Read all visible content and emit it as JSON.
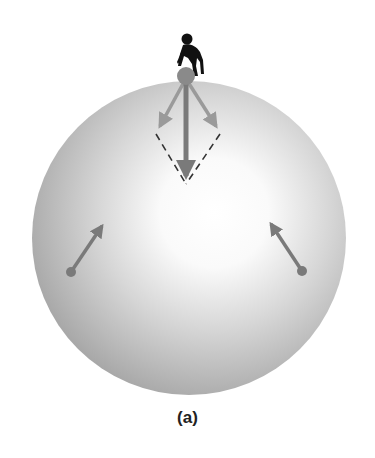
{
  "figure": {
    "caption": "(a)",
    "colors": {
      "sphere_light": "#ffffff",
      "sphere_dark": "#a8a8a8",
      "arrow": "#7a7a7a",
      "dashed": "#333333",
      "person": "#111111"
    },
    "elements": {
      "sphere": {
        "cx": 189,
        "cy": 238,
        "r": 157
      },
      "ball": {
        "cx": 186,
        "cy": 76,
        "r": 9
      },
      "net_force_arrow": {
        "x1": 186,
        "y1": 80,
        "x2": 186,
        "y2": 182
      },
      "component_arrow_left": {
        "x1": 184,
        "y1": 80,
        "x2": 160,
        "y2": 128
      },
      "component_arrow_right": {
        "x1": 188,
        "y1": 80,
        "x2": 218,
        "y2": 128
      },
      "dashed_left": {
        "x1": 156,
        "y1": 134,
        "x2": 186,
        "y2": 184
      },
      "dashed_right": {
        "x1": 220,
        "y1": 134,
        "x2": 186,
        "y2": 184
      },
      "mass_point_left": {
        "cx": 71,
        "cy": 272,
        "r": 5,
        "arrow_to": [
          104,
          223
        ]
      },
      "mass_point_right": {
        "cx": 302,
        "cy": 271,
        "r": 5,
        "arrow_to": [
          269,
          221
        ]
      }
    }
  }
}
